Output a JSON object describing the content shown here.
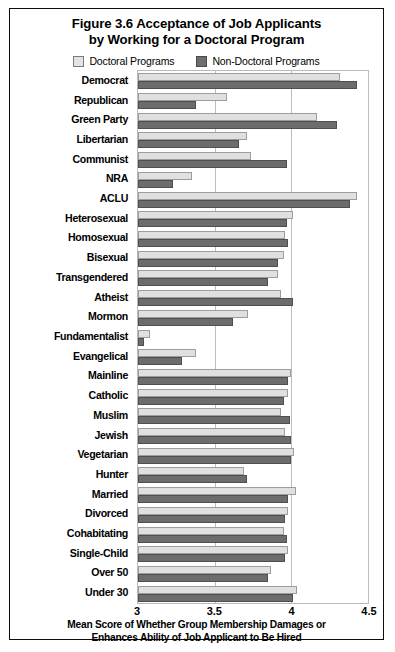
{
  "figure": {
    "title_line1": "Figure 3.6 Acceptance of Job Applicants",
    "title_line2": "by Working for a Doctoral Program",
    "legend": [
      {
        "label": "Doctoral Programs",
        "color": "#e0e0e0",
        "key": "doctoral"
      },
      {
        "label": "Non-Doctoral Programs",
        "color": "#6c6c6c",
        "key": "non_doctoral"
      }
    ],
    "xaxis_title_line1": "Mean Score of Whether Group Membership Damages or",
    "xaxis_title_line2": "Enhances Ability of Job Applicant to Be Hired"
  },
  "chart_data": {
    "type": "bar",
    "orientation": "horizontal",
    "title": "Figure 3.6 Acceptance of Job Applicants by Working for a Doctoral Program",
    "xlabel": "Mean Score of Whether Group Membership Damages or Enhances Ability of Job Applicant to Be Hired",
    "ylabel": "",
    "xlim": [
      3,
      4.5
    ],
    "xticks": [
      3,
      3.5,
      4,
      4.5
    ],
    "xtick_labels": [
      "3",
      "3.5",
      "4",
      "4.5"
    ],
    "grid": true,
    "legend_position": "top",
    "categories": [
      "Democrat",
      "Republican",
      "Green Party",
      "Libertarian",
      "Communist",
      "NRA",
      "ACLU",
      "Heterosexual",
      "Homosexual",
      "Bisexual",
      "Transgendered",
      "Atheist",
      "Mormon",
      "Fundamentalist",
      "Evangelical",
      "Mainline",
      "Catholic",
      "Muslim",
      "Jewish",
      "Vegetarian",
      "Hunter",
      "Married",
      "Divorced",
      "Cohabitating",
      "Single-Child",
      "Over 50",
      "Under 30"
    ],
    "series": [
      {
        "name": "Doctoral Programs",
        "color": "#e0e0e0",
        "values": [
          4.32,
          3.58,
          4.17,
          3.71,
          3.74,
          3.35,
          4.43,
          4.01,
          3.96,
          3.95,
          3.91,
          3.93,
          3.72,
          3.08,
          3.38,
          4.0,
          3.98,
          3.93,
          3.96,
          4.02,
          3.69,
          4.03,
          3.98,
          3.95,
          3.98,
          3.87,
          4.04
        ]
      },
      {
        "name": "Non-Doctoral Programs",
        "color": "#6c6c6c",
        "values": [
          4.43,
          3.38,
          4.3,
          3.66,
          3.97,
          3.23,
          4.38,
          3.97,
          3.98,
          3.91,
          3.85,
          4.01,
          3.62,
          3.04,
          3.29,
          3.98,
          3.95,
          3.99,
          4.0,
          4.0,
          3.71,
          3.98,
          3.96,
          3.97,
          3.96,
          3.85,
          4.01
        ]
      }
    ]
  }
}
